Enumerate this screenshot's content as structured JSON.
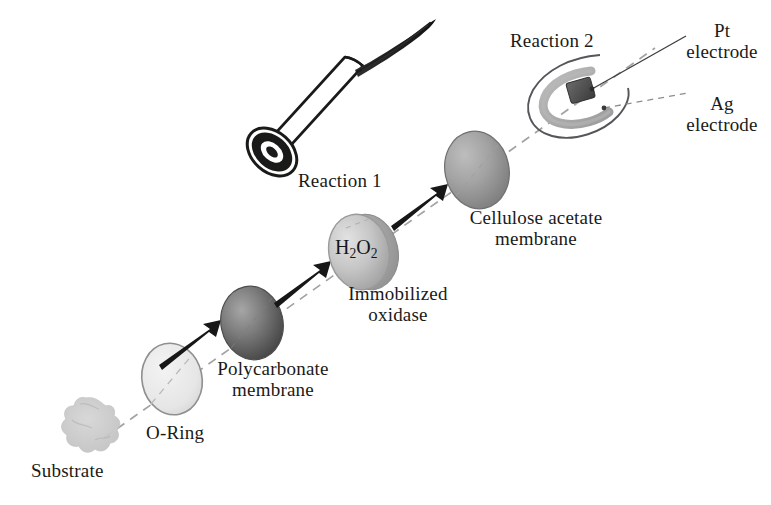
{
  "figure": {
    "width": 771,
    "height": 505,
    "background": "#ffffff",
    "ink_color": "#1a1a18"
  },
  "labels": {
    "substrate": "Substrate",
    "o_ring": "O-Ring",
    "polycarbonate_line1": "Polycarbonate",
    "polycarbonate_line2": "membrane",
    "immobilized_line1": "Immobilized",
    "immobilized_line2": "oxidase",
    "reaction_1": "Reaction 1",
    "hydrogen_peroxide": "H2O2",
    "cellulose_line1": "Cellulose acetate",
    "cellulose_line2": "membrane",
    "reaction_2": "Reaction 2",
    "pt_electrode_line1": "Pt",
    "pt_electrode_line2": "electrode",
    "ag_electrode_line1": "Ag",
    "ag_electrode_line2": "electrode"
  },
  "components": [
    {
      "id": "substrate",
      "name": "Substrate",
      "shape": "irregular-blob",
      "fill": "#c9c9c9",
      "cx": 86,
      "cy": 428
    },
    {
      "id": "o-ring",
      "name": "O-Ring",
      "shape": "ellipse-disc",
      "fill": "#ececec",
      "stroke": "#8c8c8c",
      "cx": 172,
      "cy": 379,
      "rx": 30,
      "ry": 36
    },
    {
      "id": "polycarbonate-membrane",
      "name": "Polycarbonate membrane",
      "shape": "shaded-sphere",
      "fill": "#6e6e6e",
      "cx": 252,
      "cy": 323,
      "rx": 31,
      "ry": 37
    },
    {
      "id": "immobilized-oxidase",
      "name": "Immobilized oxidase",
      "shape": "shaded-disc",
      "fill": "#c0c0c0",
      "cx": 360,
      "cy": 252,
      "rx": 32,
      "ry": 38
    },
    {
      "id": "cellulose-acetate-membrane",
      "name": "Cellulose acetate membrane",
      "shape": "shaded-sphere",
      "fill": "#9a9a9a",
      "cx": 477,
      "cy": 170,
      "rx": 33,
      "ry": 39
    },
    {
      "id": "electrode-assembly",
      "name": "Electrode assembly",
      "shape": "probe-tip",
      "cx": 571,
      "cy": 100
    },
    {
      "id": "pt-electrode",
      "name": "Pt electrode",
      "shape": "dark-rectangle",
      "fill": "#4a4a4a",
      "cx": 581,
      "cy": 92
    },
    {
      "id": "ag-electrode",
      "name": "Ag electrode",
      "shape": "horseshoe-arc",
      "fill": "#a8a8a8",
      "cx": 566,
      "cy": 99
    },
    {
      "id": "probe-body",
      "name": "Probe body cylinder",
      "shape": "cylinder",
      "fill": "#ffffff",
      "stroke": "#1a1a18"
    },
    {
      "id": "probe-cable",
      "name": "Probe cable",
      "shape": "tapered-stroke",
      "fill": "#2b2b2b"
    }
  ],
  "annotations": {
    "axis": {
      "name": "assembly axis",
      "style": "dashed",
      "color": "#9a9a9a"
    },
    "arrows": [
      {
        "id": "arrow-1",
        "from": "o-ring",
        "to": "polycarbonate-membrane"
      },
      {
        "id": "arrow-2",
        "from": "polycarbonate-membrane",
        "to": "immobilized-oxidase"
      },
      {
        "id": "arrow-3",
        "from": "immobilized-oxidase",
        "to": "cellulose-acetate-membrane"
      }
    ],
    "leaders": [
      {
        "id": "leader-pt",
        "target": "pt-electrode"
      },
      {
        "id": "leader-ag",
        "target": "ag-electrode"
      }
    ]
  }
}
